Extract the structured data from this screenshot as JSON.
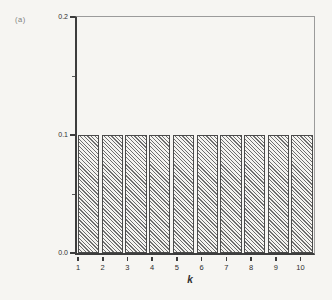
{
  "panel_label": "(a)",
  "colors": {
    "background": "#f6f5f2",
    "axis": "#3d3d3d",
    "frame": "#9b9b9b",
    "hatch": "#6e6e6e",
    "bar_fill": "#f4f3f0",
    "text": "#2e2e2e",
    "panel_label_color": "#7d7d7d"
  },
  "chart_data": {
    "type": "bar",
    "title": "",
    "xlabel": "k",
    "ylabel": "Pr(Z=k)",
    "categories": [
      "1",
      "2",
      "3",
      "4",
      "5",
      "6",
      "7",
      "8",
      "9",
      "10"
    ],
    "values": [
      0.1,
      0.1,
      0.1,
      0.1,
      0.1,
      0.1,
      0.1,
      0.1,
      0.1,
      0.1
    ],
    "ylim": [
      0.0,
      0.2
    ],
    "ytick_labels": [
      "0.0",
      "0.1",
      "0.2"
    ],
    "ytick_values": [
      0.0,
      0.1,
      0.2
    ],
    "yminor_tick_values": [
      0.05,
      0.15
    ],
    "bar_style": "diagonal-hatch",
    "grid": false,
    "legend": "none"
  }
}
